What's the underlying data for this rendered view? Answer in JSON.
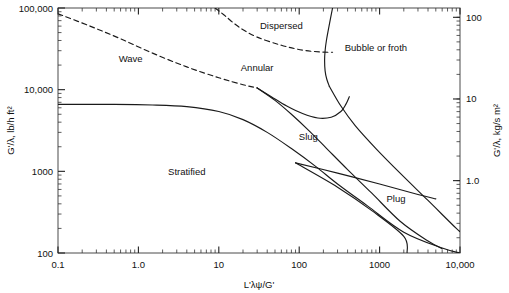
{
  "chart_data": {
    "type": "line",
    "title": "",
    "subtitle": "",
    "xlabel": "L'λψ/G'",
    "ylabel": "G'/λ, lb/h ft²",
    "ylabel_right": "G'/λ, kg/s m²",
    "xscale": "log",
    "yscale": "log",
    "xlim": [
      0.1,
      10000
    ],
    "ylim": [
      100,
      100000
    ],
    "ylim_right": [
      0.13,
      130
    ],
    "grid": false,
    "legend": "none",
    "xticks": [
      "0.1",
      "1.0",
      "10",
      "100",
      "1000",
      "10,000"
    ],
    "xtick_values": [
      0.1,
      1,
      10,
      100,
      1000,
      10000
    ],
    "yticks": [
      "100",
      "1000",
      "10,000",
      "100,000"
    ],
    "ytick_values": [
      100,
      1000,
      10000,
      100000
    ],
    "yticks_right": [
      "1.0",
      "10",
      "100"
    ],
    "ytick_right_values": [
      1.0,
      10,
      100
    ],
    "annotations": [
      {
        "text": "Wave",
        "x": 0.8,
        "y": 22000
      },
      {
        "text": "Dispersed",
        "x": 60,
        "y": 55000
      },
      {
        "text": "Annular",
        "x": 30,
        "y": 17000
      },
      {
        "text": "Bubble or froth",
        "x": 900,
        "y": 30000
      },
      {
        "text": "Stratified",
        "x": 4,
        "y": 900
      },
      {
        "text": "Slug",
        "x": 130,
        "y": 2400
      },
      {
        "text": "Plug",
        "x": 1600,
        "y": 420
      }
    ],
    "series": [
      {
        "name": "dispersed-boundary-left",
        "style": "dashed",
        "points": [
          [
            0.1,
            85000
          ],
          [
            0.25,
            60000
          ],
          [
            0.6,
            42000
          ],
          [
            1.5,
            28000
          ],
          [
            4,
            19000
          ],
          [
            10,
            14000
          ],
          [
            20,
            11500
          ],
          [
            30,
            10500
          ]
        ]
      },
      {
        "name": "dispersed-boundary-top",
        "style": "dashed",
        "points": [
          [
            9,
            100000
          ],
          [
            12,
            80000
          ],
          [
            18,
            58000
          ],
          [
            30,
            44000
          ],
          [
            60,
            35000
          ],
          [
            110,
            30500
          ],
          [
            180,
            29000
          ],
          [
            260,
            28700
          ]
        ]
      },
      {
        "name": "wave-stratified-boundary",
        "style": "solid",
        "points": [
          [
            0.1,
            6600
          ],
          [
            0.5,
            6600
          ],
          [
            1.5,
            6500
          ],
          [
            4,
            6200
          ],
          [
            10,
            5400
          ],
          [
            20,
            4300
          ],
          [
            40,
            3000
          ],
          [
            80,
            1900
          ],
          [
            160,
            1150
          ],
          [
            300,
            700
          ],
          [
            700,
            380
          ],
          [
            2000,
            180
          ],
          [
            6000,
            115
          ],
          [
            10000,
            100
          ]
        ]
      },
      {
        "name": "annular-lower-boundary",
        "style": "solid",
        "points": [
          [
            30,
            10500
          ],
          [
            45,
            8200
          ],
          [
            70,
            6300
          ],
          [
            110,
            5100
          ],
          [
            170,
            4500
          ],
          [
            250,
            4600
          ],
          [
            330,
            5400
          ],
          [
            380,
            6600
          ],
          [
            420,
            8200
          ]
        ]
      },
      {
        "name": "annular-slug-boundary",
        "style": "solid",
        "points": [
          [
            30,
            10500
          ],
          [
            50,
            7400
          ],
          [
            80,
            5000
          ],
          [
            130,
            3200
          ],
          [
            220,
            1900
          ],
          [
            400,
            1050
          ],
          [
            800,
            540
          ],
          [
            1800,
            245
          ],
          [
            4000,
            140
          ],
          [
            6000,
            113
          ]
        ]
      },
      {
        "name": "bubble-boundary-vertical",
        "style": "solid",
        "points": [
          [
            260,
            100000
          ],
          [
            235,
            60000
          ],
          [
            218,
            40000
          ],
          [
            210,
            30000
          ],
          [
            207,
            23000
          ],
          [
            210,
            17000
          ],
          [
            220,
            13500
          ],
          [
            237,
            11000
          ]
        ]
      },
      {
        "name": "slug-bubble-boundary",
        "style": "solid",
        "points": [
          [
            237,
            11000
          ],
          [
            330,
            6300
          ],
          [
            500,
            3600
          ],
          [
            900,
            1900
          ],
          [
            1800,
            950
          ],
          [
            4000,
            440
          ],
          [
            9000,
            200
          ],
          [
            10000,
            185
          ]
        ]
      },
      {
        "name": "plug-upper-boundary",
        "style": "solid",
        "points": [
          [
            90,
            1270
          ],
          [
            300,
            950
          ],
          [
            1000,
            700
          ],
          [
            3000,
            520
          ],
          [
            5000,
            460
          ]
        ]
      },
      {
        "name": "plug-lower-boundary",
        "style": "solid",
        "points": [
          [
            90,
            1270
          ],
          [
            300,
            640
          ],
          [
            800,
            330
          ],
          [
            2000,
            160
          ],
          [
            2200,
            100
          ]
        ]
      }
    ]
  }
}
